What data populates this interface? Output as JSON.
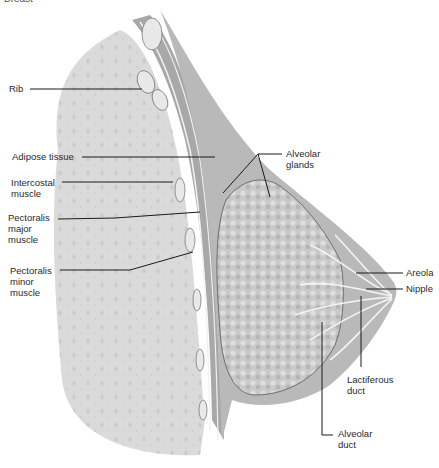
{
  "figure": {
    "title_partial": "Breast",
    "colors": {
      "background": "#ffffff",
      "rib_cage_fill": "#dcdcdc",
      "chest_wall": "#9a9a9a",
      "breast_tissue": "#bdbdbd",
      "gland": "#cfcfcf",
      "leader_line": "#1a1a1a"
    }
  },
  "labels": {
    "rib": "Rib",
    "adipose_tissue": "Adipose tissue",
    "intercostal_muscle": "Intercostal\nmuscle",
    "pectoralis_major": "Pectoralis\nmajor\nmuscle",
    "pectoralis_minor": "Pectoralis\nminor\nmuscle",
    "alveolar_glands": "Alveolar\nglands",
    "areola": "Areola",
    "nipple": "Nipple",
    "lactiferous_duct": "Lactiferous\nduct",
    "alveolar_duct": "Alveolar\nduct"
  }
}
